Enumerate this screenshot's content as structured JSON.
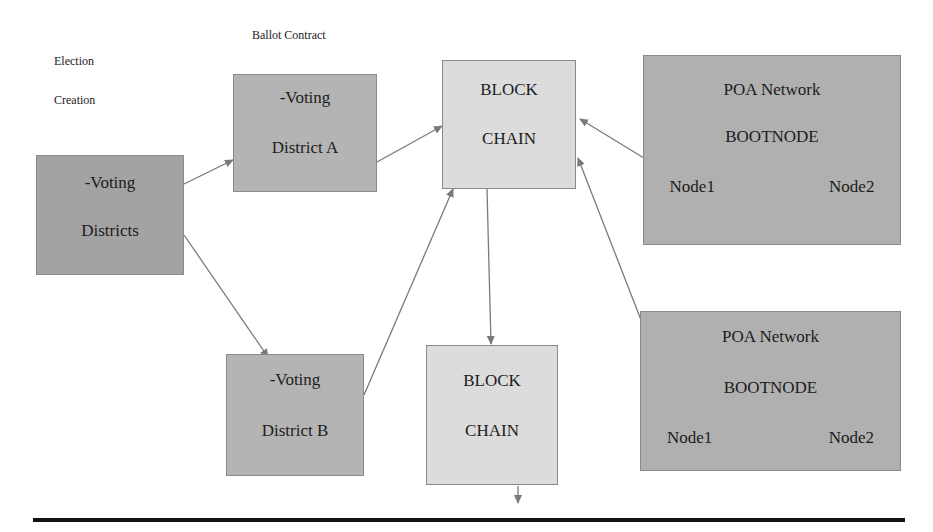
{
  "labels": {
    "election_line1": "Election",
    "election_line2": "Creation",
    "ballot_contract": "Ballot Contract"
  },
  "boxes": {
    "voting_districts": {
      "line1": "-Voting",
      "line2": "Districts"
    },
    "district_a": {
      "line1": "-Voting",
      "line2": "District A"
    },
    "district_b": {
      "line1": "-Voting",
      "line2": "District B"
    },
    "blockchain_top": {
      "line1": "BLOCK",
      "line2": "CHAIN"
    },
    "blockchain_bottom": {
      "line1": "BLOCK",
      "line2": "CHAIN"
    },
    "poa_top": {
      "line1": "POA Network",
      "line2": "BOOTNODE",
      "node1": "Node1",
      "node2": "Node2"
    },
    "poa_bottom": {
      "line1": "POA Network",
      "line2": "BOOTNODE",
      "node1": "Node1",
      "node2": "Node2"
    }
  },
  "colors": {
    "arrow": "#7a7a7a",
    "rule": "#111111"
  }
}
